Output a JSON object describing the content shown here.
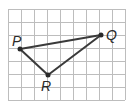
{
  "diagram": {
    "type": "triangle-on-grid",
    "grid": {
      "columns": 9,
      "rows": 7,
      "origin_x": 8,
      "origin_y": 9,
      "cell_size": 13,
      "line_color": "#bdbdbd"
    },
    "vertices": [
      {
        "id": "P",
        "label": "P",
        "x": 20,
        "y": 49,
        "label_x": 12,
        "label_y": 34
      },
      {
        "id": "Q",
        "label": "Q",
        "x": 101,
        "y": 35,
        "label_x": 106,
        "label_y": 28
      },
      {
        "id": "R",
        "label": "R",
        "x": 48,
        "y": 75,
        "label_x": 41,
        "label_y": 79
      }
    ],
    "edges": [
      [
        "P",
        "Q"
      ],
      [
        "Q",
        "R"
      ],
      [
        "R",
        "P"
      ]
    ],
    "edge_color": "#3a3a3a"
  }
}
